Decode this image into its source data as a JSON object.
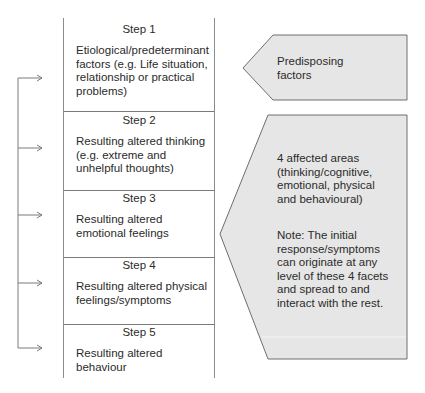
{
  "steps": [
    {
      "title": "Step 1",
      "text": "Etiological/predeterminant factors (e.g. Life situation, relationship or practical problems)"
    },
    {
      "title": "Step 2",
      "text": "Resulting altered thinking (e.g. extreme and unhelpful thoughts)"
    },
    {
      "title": "Step 3",
      "text": "Resulting altered emotional feelings"
    },
    {
      "title": "Step 4",
      "text": "Resulting altered physical feelings/symptoms"
    },
    {
      "title": "Step 5",
      "text": "Resulting altered behaviour"
    }
  ],
  "predisposing": {
    "text": "Predisposing factors"
  },
  "affected": {
    "summary": "4 affected areas (thinking/cognitive, emotional, physical and behavioural)",
    "note": "Note: The initial response/symptoms can originate at any level of these 4 facets and spread to and interact with the rest."
  },
  "colors": {
    "shape_fill": "#e6e6e6",
    "shape_stroke": "#6e6e6e",
    "line": "#7a7a7a"
  }
}
